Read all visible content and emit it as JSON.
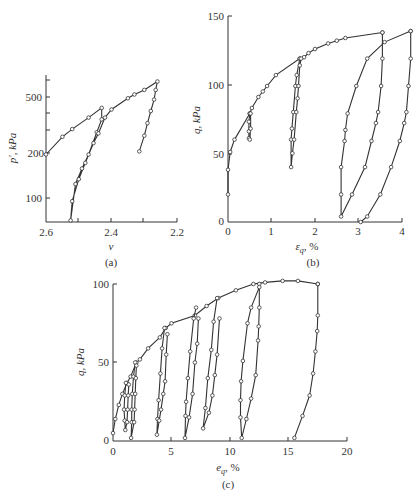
{
  "chart_data": [
    {
      "panel": "(a)",
      "type": "line",
      "xlabel": "v",
      "ylabel": "p', kPa",
      "x_ticks": [
        "2.6",
        "2.4",
        "2.2"
      ],
      "y_ticks": [
        "100",
        "200",
        "500"
      ],
      "xlim": [
        2.6,
        2.2
      ],
      "ylim_log": [
        70,
        700
      ],
      "series": [
        {
          "name": "loading-unloading-a",
          "points": [
            [
              2.6,
              200
            ],
            [
              2.55,
              265
            ],
            [
              2.52,
              300
            ],
            [
              2.47,
              360
            ],
            [
              2.43,
              420
            ],
            [
              2.43,
              350
            ],
            [
              2.445,
              285
            ],
            [
              2.47,
              200
            ],
            [
              2.49,
              160
            ],
            [
              2.51,
              125
            ],
            [
              2.525,
              70
            ],
            [
              2.52,
              95
            ],
            [
              2.5,
              135
            ],
            [
              2.48,
              175
            ],
            [
              2.455,
              240
            ],
            [
              2.44,
              280
            ],
            [
              2.42,
              360
            ],
            [
              2.4,
              410
            ],
            [
              2.35,
              490
            ],
            [
              2.33,
              520
            ],
            [
              2.3,
              560
            ],
            [
              2.26,
              640
            ],
            [
              2.265,
              560
            ],
            [
              2.27,
              480
            ],
            [
              2.28,
              400
            ],
            [
              2.29,
              330
            ],
            [
              2.3,
              270
            ],
            [
              2.315,
              210
            ]
          ]
        }
      ]
    },
    {
      "panel": "(b)",
      "type": "line",
      "xlabel": "ε_q, %",
      "ylabel": "q, kPa",
      "x_ticks": [
        "0",
        "1",
        "2",
        "3",
        "4"
      ],
      "y_ticks": [
        "0",
        "50",
        "100",
        "150"
      ],
      "xlim": [
        0,
        4
      ],
      "ylim": [
        0,
        150
      ],
      "series": [
        {
          "name": "monotonic-envelope",
          "points": [
            [
              0,
              20
            ],
            [
              0,
              38
            ],
            [
              0.05,
              51
            ],
            [
              0.15,
              60
            ],
            [
              0.5,
              79
            ],
            [
              0.55,
              83
            ],
            [
              0.7,
              91
            ],
            [
              0.8,
              95
            ],
            [
              0.9,
              99
            ],
            [
              1.1,
              107
            ],
            [
              1.65,
              119
            ],
            [
              1.75,
              120
            ],
            [
              1.85,
              123
            ],
            [
              2.0,
              126
            ],
            [
              2.3,
              130
            ],
            [
              2.5,
              132
            ],
            [
              2.7,
              134
            ],
            [
              3.55,
              138
            ]
          ]
        },
        {
          "name": "loop-0.5",
          "points": [
            [
              0.5,
              79
            ],
            [
              0.48,
              73
            ],
            [
              0.48,
              66
            ],
            [
              0.48,
              61
            ],
            [
              0.5,
              60
            ],
            [
              0.52,
              68
            ],
            [
              0.52,
              79
            ]
          ]
        },
        {
          "name": "loop-1.6",
          "points": [
            [
              1.65,
              119
            ],
            [
              1.58,
              107
            ],
            [
              1.55,
              99
            ],
            [
              1.5,
              80
            ],
            [
              1.47,
              68
            ],
            [
              1.45,
              60
            ],
            [
              1.45,
              40
            ],
            [
              1.48,
              50
            ],
            [
              1.52,
              60
            ],
            [
              1.57,
              80
            ],
            [
              1.6,
              90
            ],
            [
              1.62,
              99
            ],
            [
              1.65,
              114
            ],
            [
              1.68,
              119
            ]
          ]
        },
        {
          "name": "loop-3.5",
          "points": [
            [
              3.55,
              138
            ],
            [
              3.55,
              119
            ],
            [
              3.52,
              99
            ],
            [
              3.45,
              80
            ],
            [
              3.4,
              72
            ],
            [
              3.3,
              59
            ],
            [
              3.15,
              40
            ],
            [
              2.85,
              20
            ],
            [
              2.6,
              4
            ],
            [
              2.6,
              20
            ],
            [
              2.6,
              40
            ],
            [
              2.68,
              59
            ],
            [
              2.7,
              67
            ],
            [
              2.75,
              79
            ],
            [
              2.95,
              99
            ],
            [
              3.2,
              119
            ],
            [
              3.6,
              131
            ],
            [
              4.2,
              139
            ]
          ]
        },
        {
          "name": "loop-4.2",
          "points": [
            [
              4.2,
              139
            ],
            [
              4.2,
              119
            ],
            [
              4.15,
              99
            ],
            [
              4.1,
              80
            ],
            [
              4.05,
              72
            ],
            [
              3.95,
              59
            ],
            [
              3.75,
              40
            ],
            [
              3.5,
              20
            ],
            [
              3.2,
              4
            ],
            [
              3.05,
              0
            ]
          ]
        }
      ]
    },
    {
      "panel": "(c)",
      "type": "line",
      "xlabel": "ε_q, %",
      "ylabel": "q, kPa",
      "x_ticks": [
        "0",
        "5",
        "10",
        "15",
        "20"
      ],
      "y_ticks": [
        "0",
        "50",
        "100"
      ],
      "xlim": [
        0,
        20
      ],
      "ylim": [
        0,
        100
      ],
      "series": [
        {
          "name": "monotonic-envelope",
          "points": [
            [
              0,
              5
            ],
            [
              0.2,
              14
            ],
            [
              0.5,
              23
            ],
            [
              0.8,
              30
            ],
            [
              1.2,
              37
            ],
            [
              1.5,
              41
            ],
            [
              2,
              50
            ],
            [
              2.3,
              52
            ],
            [
              3,
              59
            ],
            [
              4,
              66
            ],
            [
              4.5,
              72
            ],
            [
              5,
              75
            ],
            [
              7,
              80
            ],
            [
              8,
              86
            ],
            [
              9,
              91
            ],
            [
              10.5,
              96
            ],
            [
              12,
              100
            ],
            [
              13,
              101
            ],
            [
              14.5,
              102
            ],
            [
              15.8,
              102
            ],
            [
              17.5,
              100
            ]
          ]
        },
        {
          "name": "loop-1",
          "points": [
            [
              1.1,
              37
            ],
            [
              1,
              29
            ],
            [
              0.95,
              20
            ],
            [
              1,
              13
            ],
            [
              1.05,
              7
            ],
            [
              1.2,
              12
            ],
            [
              1.25,
              20
            ],
            [
              1.3,
              29
            ],
            [
              1.35,
              36
            ]
          ]
        },
        {
          "name": "loop-1.7",
          "points": [
            [
              1.9,
              50
            ],
            [
              1.75,
              41
            ],
            [
              1.65,
              30
            ],
            [
              1.6,
              20
            ],
            [
              1.6,
              12
            ],
            [
              1.55,
              2
            ],
            [
              1.8,
              12
            ],
            [
              1.85,
              20
            ],
            [
              1.9,
              30
            ],
            [
              1.95,
              40
            ],
            [
              2,
              48
            ]
          ]
        },
        {
          "name": "loop-4",
          "points": [
            [
              4.4,
              72
            ],
            [
              4.2,
              59
            ],
            [
              4.05,
              43
            ],
            [
              3.9,
              26
            ],
            [
              3.8,
              14
            ],
            [
              3.75,
              4
            ],
            [
              3.95,
              13
            ],
            [
              4.1,
              20
            ],
            [
              4.3,
              30
            ],
            [
              4.45,
              38
            ],
            [
              4.55,
              55
            ],
            [
              4.65,
              68
            ]
          ]
        },
        {
          "name": "loop-6.8",
          "points": [
            [
              7.1,
              85
            ],
            [
              6.9,
              78
            ],
            [
              6.6,
              57
            ],
            [
              6.4,
              40
            ],
            [
              6.25,
              25
            ],
            [
              6.2,
              16
            ],
            [
              6.15,
              2
            ],
            [
              6.5,
              15
            ],
            [
              6.8,
              30
            ],
            [
              7.0,
              50
            ],
            [
              7.2,
              62
            ],
            [
              7.3,
              78
            ]
          ]
        },
        {
          "name": "loop-8.5",
          "points": [
            [
              8.9,
              91
            ],
            [
              8.6,
              76
            ],
            [
              8.4,
              58
            ],
            [
              8.1,
              40
            ],
            [
              7.9,
              21
            ],
            [
              7.7,
              8
            ],
            [
              8.2,
              18
            ],
            [
              8.5,
              29
            ],
            [
              8.7,
              42
            ],
            [
              8.9,
              55
            ],
            [
              9.1,
              78
            ]
          ]
        },
        {
          "name": "loop-12.5",
          "points": [
            [
              12.5,
              100
            ],
            [
              12.5,
              85
            ],
            [
              12.45,
              73
            ],
            [
              12.4,
              64
            ],
            [
              12.2,
              42
            ],
            [
              11.8,
              27
            ],
            [
              11.4,
              14
            ],
            [
              11,
              2
            ],
            [
              10.9,
              15
            ],
            [
              10.9,
              26
            ],
            [
              10.95,
              38
            ],
            [
              11.1,
              51
            ],
            [
              11.5,
              75
            ],
            [
              11.8,
              85
            ],
            [
              12.5,
              98
            ]
          ]
        },
        {
          "name": "loop-17.5",
          "points": [
            [
              17.5,
              100
            ],
            [
              17.5,
              80
            ],
            [
              17.45,
              70
            ],
            [
              17.3,
              57
            ],
            [
              17.1,
              43
            ],
            [
              16.8,
              29
            ],
            [
              16.2,
              16
            ],
            [
              15.5,
              2
            ]
          ]
        }
      ]
    }
  ],
  "panels": {
    "a": {
      "label": "(a)",
      "xlabel": "v",
      "ylabel": "p′, kPa",
      "x_ticks": [
        "2.6",
        "2.4",
        "2.2"
      ],
      "y_ticks": [
        "500",
        "200",
        "100"
      ]
    },
    "b": {
      "label": "(b)",
      "xlabel": "ε",
      "xlabel_sub": "q",
      "xlabel_unit": ", %",
      "ylabel": "q, kPa",
      "x_ticks": [
        "0",
        "1",
        "2",
        "3",
        "4"
      ],
      "y_ticks": [
        "150",
        "100",
        "50",
        "0"
      ]
    },
    "c": {
      "label": "(c)",
      "xlabel": "e",
      "xlabel_sub": "q",
      "xlabel_unit": ", %",
      "ylabel": "q, kPa",
      "x_ticks": [
        "0",
        "5",
        "10",
        "15",
        "20"
      ],
      "y_ticks": [
        "100",
        "50",
        "0"
      ]
    }
  }
}
